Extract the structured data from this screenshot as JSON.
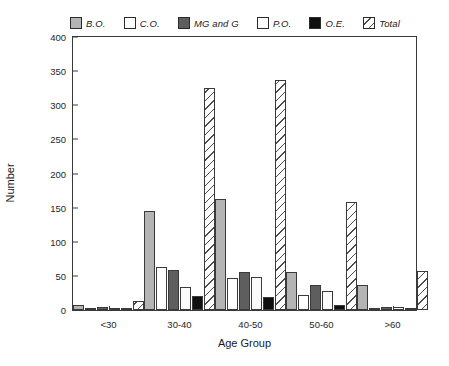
{
  "chart_data": {
    "type": "bar",
    "title": "",
    "xlabel": "Age Group",
    "ylabel": "Number",
    "ylim": [
      0,
      400
    ],
    "ytick_step": 50,
    "yticks": [
      "400",
      "350",
      "300",
      "250",
      "200",
      "150",
      "100",
      "50",
      "0"
    ],
    "grid": false,
    "legend_position": "top",
    "categories": [
      "<30",
      "30-40",
      "40-50",
      "50-60",
      ">60"
    ],
    "series": [
      {
        "name": "B.O.",
        "color": "#b4b4b4",
        "pattern": "solid-light-gray",
        "values": [
          7,
          144,
          162,
          55,
          36
        ]
      },
      {
        "name": "C.O.",
        "color": "#ffffff",
        "pattern": "solid-white",
        "values": [
          2,
          62,
          46,
          22,
          1
        ]
      },
      {
        "name": "MG and G",
        "color": "#5e5e5e",
        "pattern": "solid-dark-gray",
        "values": [
          5,
          58,
          55,
          37,
          5
        ]
      },
      {
        "name": "P.O.",
        "color": "#fbfbfb",
        "pattern": "solid-white",
        "values": [
          1,
          34,
          48,
          28,
          5
        ]
      },
      {
        "name": "O.E.",
        "color": "#101010",
        "pattern": "solid-black",
        "values": [
          1,
          21,
          19,
          7,
          3
        ]
      },
      {
        "name": "Total",
        "color": "#ffffff",
        "pattern": "diagonal-hatch",
        "values": [
          13,
          323,
          335,
          157,
          57
        ]
      }
    ]
  },
  "legend": {
    "entries": [
      {
        "label": "B.O."
      },
      {
        "label": "C.O."
      },
      {
        "label": "MG and G"
      },
      {
        "label": "P.O."
      },
      {
        "label": "O.E."
      },
      {
        "label": "Total"
      }
    ]
  }
}
